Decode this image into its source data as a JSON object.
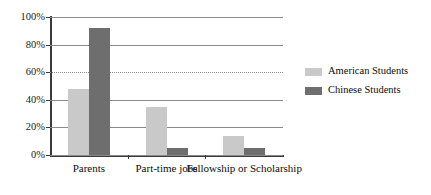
{
  "chart_data": {
    "type": "bar",
    "title": "",
    "xlabel": "",
    "ylabel": "",
    "categories": [
      "Parents",
      "Part-time jobs",
      "Fellowship or Scholarship"
    ],
    "series": [
      {
        "name": "American Students",
        "color": "#c9c9c9",
        "values": [
          48,
          35,
          14
        ]
      },
      {
        "name": "Chinese Students",
        "color": "#6e6e6e",
        "values": [
          92,
          5,
          5
        ]
      }
    ],
    "ylim": [
      0,
      100
    ],
    "ytick_values": [
      0,
      20,
      40,
      60,
      80,
      100
    ],
    "ytick_labels": [
      "0%",
      "20%",
      "40%",
      "60%",
      "80%",
      "100%"
    ],
    "grid": true,
    "grid_styles": [
      "solid",
      "solid",
      "solid",
      "dotted",
      "solid",
      "solid"
    ],
    "legend_position": "right",
    "value_format": "percent"
  },
  "axis": {
    "y_labels": [
      "100%",
      "80%",
      "60%",
      "40%",
      "20%",
      "0%"
    ]
  },
  "legend": {
    "items": [
      {
        "label": "American Students",
        "swatch": "light"
      },
      {
        "label": "Chinese Students",
        "swatch": "dark"
      }
    ]
  }
}
